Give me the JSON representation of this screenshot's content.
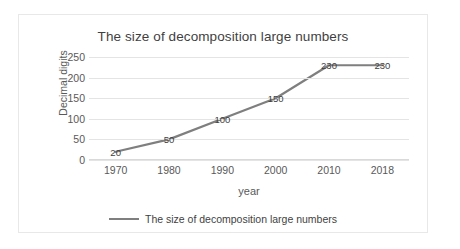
{
  "chart_data": {
    "type": "line",
    "title": "The size of decomposition large numbers",
    "xlabel": "year",
    "ylabel": "Decimal digits",
    "categories": [
      "1970",
      "1980",
      "1990",
      "2000",
      "2010",
      "2018"
    ],
    "values": [
      20,
      50,
      100,
      150,
      230,
      230
    ],
    "data_labels": [
      "20",
      "50",
      "100",
      "150",
      "230",
      "230"
    ],
    "yticks": [
      250,
      200,
      150,
      100,
      50,
      0
    ],
    "ylim": [
      0,
      250
    ],
    "grid": "horizontal",
    "legend_position": "bottom",
    "series": [
      {
        "name": "The size of decomposition large numbers",
        "values": [
          20,
          50,
          100,
          150,
          230,
          230
        ],
        "color": "#7f7f7f"
      }
    ]
  },
  "legend": {
    "label": "The size of decomposition large numbers"
  },
  "colors": {
    "line": "#7f7f7f",
    "grid": "#e4e4e4",
    "border": "#e8e8e8",
    "text": "#3f3f3f",
    "tick_text": "#595959"
  }
}
